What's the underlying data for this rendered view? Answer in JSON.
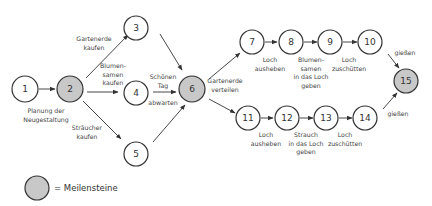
{
  "diagram": {
    "colors": {
      "milestone_fill": "#c8c8c8",
      "node_fill": "#ffffff",
      "stroke": "#333333"
    },
    "nodes": [
      {
        "id": "1",
        "label": "1",
        "milestone": false
      },
      {
        "id": "2",
        "label": "2",
        "milestone": true
      },
      {
        "id": "3",
        "label": "3",
        "milestone": false
      },
      {
        "id": "4",
        "label": "4",
        "milestone": false
      },
      {
        "id": "5",
        "label": "5",
        "milestone": false
      },
      {
        "id": "6",
        "label": "6",
        "milestone": true
      },
      {
        "id": "7",
        "label": "7",
        "milestone": false
      },
      {
        "id": "8",
        "label": "8",
        "milestone": false
      },
      {
        "id": "9",
        "label": "9",
        "milestone": false
      },
      {
        "id": "10",
        "label": "10",
        "milestone": false
      },
      {
        "id": "11",
        "label": "11",
        "milestone": false
      },
      {
        "id": "12",
        "label": "12",
        "milestone": false
      },
      {
        "id": "13",
        "label": "13",
        "milestone": false
      },
      {
        "id": "14",
        "label": "14",
        "milestone": false
      },
      {
        "id": "15",
        "label": "15",
        "milestone": true
      }
    ],
    "edges": [
      {
        "from": "1",
        "to": "2",
        "label": [
          "Planung der",
          "Neugestaltung"
        ]
      },
      {
        "from": "2",
        "to": "3",
        "label": [
          "Gartenerde",
          "kaufen"
        ]
      },
      {
        "from": "2",
        "to": "4",
        "label": [
          "Blumen-",
          "samen",
          "kaufen"
        ]
      },
      {
        "from": "2",
        "to": "5",
        "label": [
          "Sträucher",
          "kaufen"
        ]
      },
      {
        "from": "3",
        "to": "6",
        "label": []
      },
      {
        "from": "4",
        "to": "6",
        "label": [
          "Schönen",
          "Tag",
          "abwarten"
        ]
      },
      {
        "from": "5",
        "to": "6",
        "label": []
      },
      {
        "from": "6",
        "to": "7",
        "label": [
          "Gartenerde",
          "verteilen"
        ]
      },
      {
        "from": "6",
        "to": "11",
        "label": []
      },
      {
        "from": "7",
        "to": "8",
        "label": [
          "Loch",
          "ausheben"
        ]
      },
      {
        "from": "8",
        "to": "9",
        "label": [
          "Blumen-",
          "samen",
          "in das Loch",
          "geben"
        ]
      },
      {
        "from": "9",
        "to": "10",
        "label": [
          "Loch",
          "zuschütten"
        ]
      },
      {
        "from": "10",
        "to": "15",
        "label": [
          "gießen"
        ]
      },
      {
        "from": "11",
        "to": "12",
        "label": [
          "Loch",
          "ausheben"
        ]
      },
      {
        "from": "12",
        "to": "13",
        "label": [
          "Strauch",
          "in das Loch",
          "geben"
        ]
      },
      {
        "from": "13",
        "to": "14",
        "label": [
          "Loch",
          "zuschütten"
        ]
      },
      {
        "from": "14",
        "to": "15",
        "label": [
          "gießen"
        ]
      }
    ],
    "labels": {
      "e1_2": [
        "Planung der",
        "Neugestaltung"
      ],
      "e2_3": [
        "Gartenerde",
        "kaufen"
      ],
      "e2_4": [
        "Blumen-",
        "samen",
        "kaufen"
      ],
      "e2_5": [
        "Sträucher",
        "kaufen"
      ],
      "e4_6": [
        "Schönen",
        "Tag",
        "abwarten"
      ],
      "e6_7": [
        "Gartenerde",
        "verteilen"
      ],
      "e7_8": [
        "Loch",
        "ausheben"
      ],
      "e8_9": [
        "Blumen-",
        "samen",
        "in das Loch",
        "geben"
      ],
      "e9_10": [
        "Loch",
        "zuschütten"
      ],
      "e10_15": [
        "gießen"
      ],
      "e11_12": [
        "Loch",
        "ausheben"
      ],
      "e12_13": [
        "Strauch",
        "in das Loch",
        "geben"
      ],
      "e13_14": [
        "Loch",
        "zuschütten"
      ],
      "e14_15": [
        "gießen"
      ]
    }
  },
  "legend": {
    "symbol": "milestone-circle",
    "text": "= Meilensteine"
  }
}
